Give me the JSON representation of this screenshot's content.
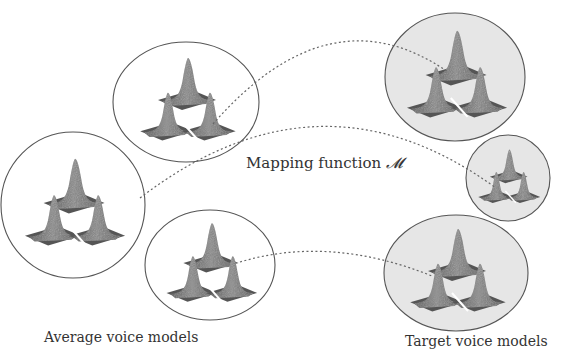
{
  "diagram": {
    "mapping_label": "Mapping function",
    "mapping_symbol": "𝓜",
    "average_label": "Average voice models",
    "target_label": "Target voice models",
    "colors": {
      "background": "#ffffff",
      "ellipse_stroke": "#555555",
      "target_fill": "#e6e6e6",
      "average_fill": "#ffffff",
      "peak_fill": "#6e6e6e",
      "base_fill": "#505050",
      "dashed_line": "#666666"
    },
    "average_models": [
      {
        "cx": 186,
        "cy": 102,
        "rx": 73,
        "ry": 60,
        "scale": 1.0
      },
      {
        "cx": 73,
        "cy": 205,
        "rx": 72,
        "ry": 73,
        "scale": 1.05
      },
      {
        "cx": 210,
        "cy": 265,
        "rx": 65,
        "ry": 55,
        "scale": 0.95
      }
    ],
    "target_models": [
      {
        "cx": 455,
        "cy": 77,
        "rx": 70,
        "ry": 64,
        "scale": 1.05
      },
      {
        "cx": 508,
        "cy": 178,
        "rx": 42,
        "ry": 43,
        "scale": 0.65
      },
      {
        "cx": 456,
        "cy": 273,
        "rx": 72,
        "ry": 58,
        "scale": 1.0
      }
    ],
    "mappings": [
      {
        "from": 0,
        "to": 0,
        "path": "M 213 124 Q 330 -10 448 72"
      },
      {
        "from": 1,
        "to": 1,
        "path": "M 140 198 Q 320 60 496 188"
      },
      {
        "from": 2,
        "to": 2,
        "path": "M 240 262 Q 330 235 432 276"
      }
    ]
  }
}
